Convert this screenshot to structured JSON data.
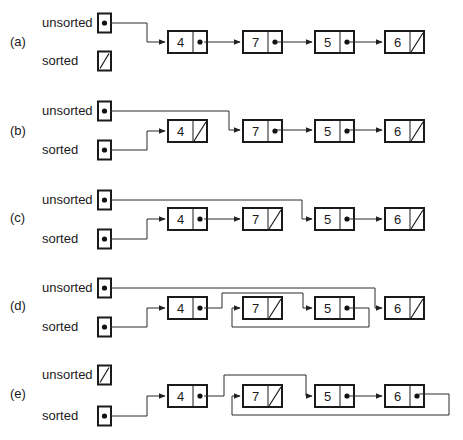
{
  "diagram": {
    "labels": {
      "unsorted": "unsorted",
      "sorted": "sorted"
    },
    "panels": [
      {
        "id": "a",
        "tag": "(a)",
        "y_unsorted": 23,
        "y_sorted": 61,
        "y_nodes": 42,
        "tag_y": 46,
        "unsorted_null": false,
        "sorted_null": true,
        "nodes": [
          {
            "value": "4",
            "x": 168,
            "next": "null_none",
            "null": false
          },
          {
            "value": "7",
            "x": 243,
            "null": false
          },
          {
            "value": "5",
            "x": 315,
            "null": false
          },
          {
            "value": "6",
            "x": 385,
            "null": true
          }
        ],
        "wires": [
          {
            "from": "unsorted",
            "path": "M110 23 L147 23 L147 42 L165 42"
          },
          {
            "path": "M204 42 L240 42"
          },
          {
            "path": "M276 42 L312 42"
          },
          {
            "path": "M348 42 L382 42"
          }
        ]
      },
      {
        "id": "b",
        "tag": "(b)",
        "y_unsorted": 111,
        "y_sorted": 150,
        "y_nodes": 131,
        "tag_y": 135,
        "unsorted_null": false,
        "sorted_null": false,
        "nodes": [
          {
            "value": "4",
            "x": 168,
            "null": true
          },
          {
            "value": "7",
            "x": 243,
            "null": false
          },
          {
            "value": "5",
            "x": 315,
            "null": false
          },
          {
            "value": "6",
            "x": 385,
            "null": true
          }
        ],
        "wires": [
          {
            "path": "M110 111 L229 111 L229 130 L240 130"
          },
          {
            "path": "M110 150 L147 150 L147 131 L165 131"
          },
          {
            "path": "M276 130 L312 130"
          },
          {
            "path": "M348 130 L382 130"
          }
        ]
      },
      {
        "id": "c",
        "tag": "(c)",
        "y_unsorted": 200,
        "y_sorted": 239,
        "y_nodes": 219,
        "tag_y": 222,
        "unsorted_null": false,
        "sorted_null": false,
        "nodes": [
          {
            "value": "4",
            "x": 168,
            "null": false
          },
          {
            "value": "7",
            "x": 243,
            "null": true
          },
          {
            "value": "5",
            "x": 315,
            "null": false
          },
          {
            "value": "6",
            "x": 385,
            "null": true
          }
        ],
        "wires": [
          {
            "path": "M110 200 L302 200 L302 219 L312 219"
          },
          {
            "path": "M110 239 L147 239 L147 219 L165 219"
          },
          {
            "path": "M204 219 L240 219"
          },
          {
            "path": "M348 219 L382 219"
          }
        ]
      },
      {
        "id": "d",
        "tag": "(d)",
        "y_unsorted": 288,
        "y_sorted": 327,
        "y_nodes": 308,
        "tag_y": 310,
        "unsorted_null": false,
        "sorted_null": false,
        "nodes": [
          {
            "value": "4",
            "x": 168,
            "null": false
          },
          {
            "value": "7",
            "x": 243,
            "null": true
          },
          {
            "value": "5",
            "x": 315,
            "null": false
          },
          {
            "value": "6",
            "x": 385,
            "null": true
          }
        ],
        "wires": [
          {
            "path": "M110 288 L375 288 L375 308 L382 308"
          },
          {
            "path": "M110 327 L147 327 L147 308 L165 308"
          },
          {
            "path": "M204 308 L222 308 L222 293 L303 293 L303 308 L312 308"
          },
          {
            "path": "M348 308 L369 308 L369 327 L232 327 L232 308 L240 308"
          }
        ]
      },
      {
        "id": "e",
        "tag": "(e)",
        "y_unsorted": 375,
        "y_sorted": 416,
        "y_nodes": 396,
        "tag_y": 398,
        "unsorted_null": true,
        "sorted_null": false,
        "nodes": [
          {
            "value": "4",
            "x": 168,
            "null": false
          },
          {
            "value": "7",
            "x": 243,
            "null": true
          },
          {
            "value": "5",
            "x": 315,
            "null": false
          },
          {
            "value": "6",
            "x": 385,
            "null": false
          }
        ],
        "wires": [
          {
            "path": "M110 416 L147 416 L147 396 L165 396"
          },
          {
            "path": "M204 396 L224 396 L224 375 L306 375 L306 396 L312 396"
          },
          {
            "path": "M348 396 L382 396"
          },
          {
            "path": "M419 394 L449 394 L449 415 L232 415 L232 396 L240 396"
          }
        ]
      }
    ]
  }
}
